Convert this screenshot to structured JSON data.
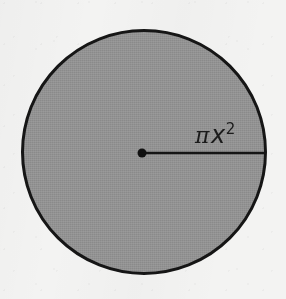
{
  "figure": {
    "kind": "geometry-diagram",
    "canvas": {
      "width": 286,
      "height": 299
    },
    "background_color": "#f3f3f2"
  },
  "circle": {
    "name": "shaded-disc",
    "center_x": 144,
    "center_y": 152,
    "radius": 123,
    "fill_color": "#9b9b9b",
    "stroke_color": "#161616",
    "stroke_width": 3
  },
  "center_point": {
    "name": "center-dot",
    "x": 142,
    "y": 153,
    "diameter": 9,
    "color": "#121212"
  },
  "radius_line": {
    "name": "radius-segment",
    "x1": 142,
    "y1": 153,
    "x2": 266,
    "y2": 153,
    "color": "#161616",
    "stroke_width": 2.6
  },
  "label": {
    "name": "area-formula",
    "full_text": "πx²",
    "pi": "π",
    "variable": "x",
    "exponent": "2",
    "color": "#1b1b1b"
  }
}
